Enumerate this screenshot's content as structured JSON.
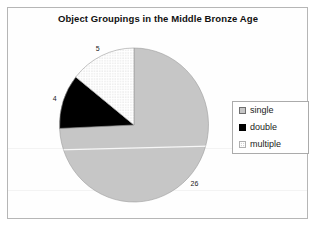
{
  "chart_data": {
    "type": "pie",
    "title": "Object Groupings in the Middle Bronze Age",
    "categories": [
      "single",
      "double",
      "multiple"
    ],
    "values": [
      26,
      4,
      5
    ],
    "total": 35,
    "data_labels": [
      "26",
      "4",
      "5"
    ],
    "start_angle": "12-oclock, clockwise",
    "legend": {
      "position": "right",
      "entries": [
        "single",
        "double",
        "multiple"
      ]
    },
    "slice_styles": [
      {
        "fill": "#c6c6c6",
        "desc": "solid light gray"
      },
      {
        "fill": "#000000",
        "desc": "solid black"
      },
      {
        "fill": "pattern:dots",
        "desc": "white with fine gray dot pattern"
      }
    ]
  },
  "colors": {
    "background": "#ffffff",
    "frame_border": "#b6b6b6",
    "legend_border": "#ababab",
    "slice_outline": "#9c9c9c",
    "label_text": "#1a1a1a",
    "title_text": "#111111"
  }
}
